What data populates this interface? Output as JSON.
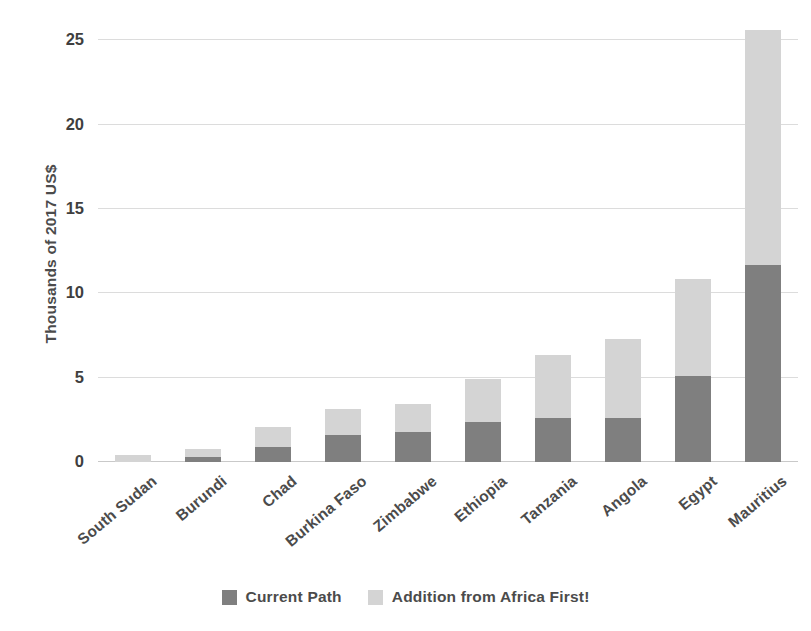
{
  "chart_data": {
    "type": "bar",
    "title": "",
    "subtitle": "",
    "stacked": true,
    "orientation": "vertical",
    "xlabel": "",
    "ylabel": "Thousands of 2017 US$",
    "ylim": [
      0,
      26.8
    ],
    "yticks": [
      0,
      5,
      10,
      15,
      20,
      25
    ],
    "ytick_labels": [
      "0",
      "5",
      "10",
      "15",
      "20",
      "25"
    ],
    "grid": true,
    "grid_axis": "y",
    "legend_position": "bottom",
    "categories": [
      "South Sudan",
      "Burundi",
      "Chad",
      "Burkina Faso",
      "Zimbabwe",
      "Ethiopia",
      "Tanzania",
      "Angola",
      "Egypt",
      "Mauritius"
    ],
    "series": [
      {
        "name": "Current Path",
        "color": "#7f7f7f",
        "values": [
          0.0,
          0.3,
          0.9,
          1.6,
          1.8,
          2.35,
          2.6,
          2.6,
          5.1,
          11.7
        ]
      },
      {
        "name": "Addition from Africa First!",
        "color": "#d4d4d4",
        "values": [
          0.4,
          0.5,
          1.15,
          1.55,
          1.65,
          2.55,
          3.75,
          4.7,
          5.75,
          13.9
        ]
      }
    ],
    "totals": [
      0.4,
      0.8,
      2.05,
      3.15,
      3.45,
      4.9,
      6.35,
      7.3,
      10.85,
      25.6
    ]
  },
  "legend": {
    "items": [
      {
        "label": "Current Path",
        "color": "#7f7f7f"
      },
      {
        "label": "Addition from Africa First!",
        "color": "#d4d4d4"
      }
    ]
  },
  "colors": {
    "gridline": "#dcdcdc",
    "baseline": "#c9c9c9",
    "text": "#4b4b4b",
    "background": "#ffffff"
  }
}
